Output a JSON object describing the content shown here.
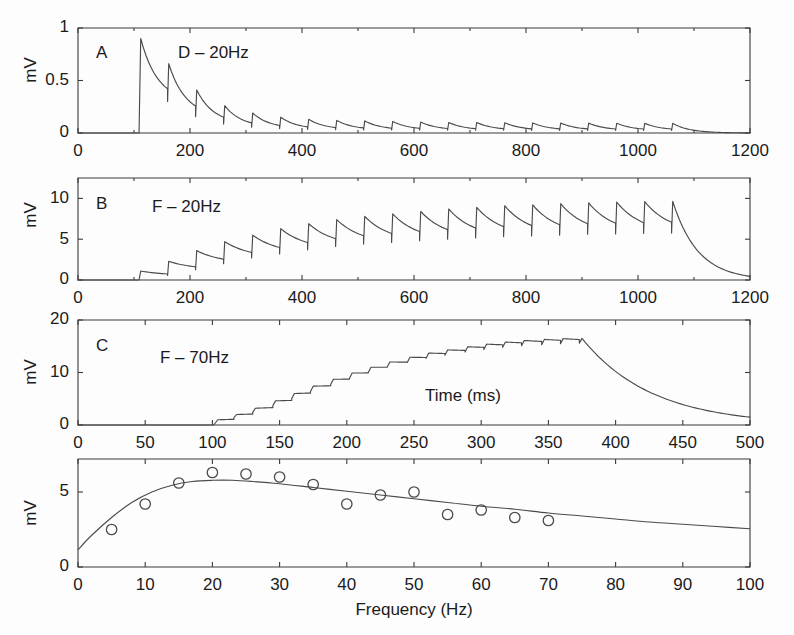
{
  "figure": {
    "background": "#fdfdfd",
    "line_color": "#4a4a4a",
    "axis_color": "#3a3a3a",
    "text_color": "#1b1b1b"
  },
  "chart_data": [
    {
      "id": "panel-a",
      "type": "line",
      "panel_letter": "A",
      "annotation": "D – 20Hz",
      "title": "",
      "xlabel": "",
      "ylabel": "mV",
      "xlim": [
        0,
        1200
      ],
      "ylim": [
        0,
        1
      ],
      "xticks": [
        0,
        200,
        400,
        600,
        800,
        1000,
        1200
      ],
      "xticklabels": [
        "0",
        "200",
        "400",
        "600",
        "800",
        "1000",
        "1200"
      ],
      "yticks": [
        0,
        0.5,
        1
      ],
      "yticklabels": [
        "0",
        "0.5",
        "1"
      ],
      "minor_xticks": [
        100,
        300,
        500,
        700,
        900,
        1100
      ],
      "grid": false,
      "legend": "none",
      "stim_onset_ms": 100,
      "stim_offset_ms": 1100,
      "stim_freq_hz": 20,
      "description": "Depressing synapse, 20 Hz train: first EPSP ~0.90 mV, strong depression to steady state ~0.09 mV",
      "peaks": [
        {
          "t": 112,
          "v": 0.9
        },
        {
          "t": 162,
          "v": 0.66
        },
        {
          "t": 212,
          "v": 0.41
        },
        {
          "t": 262,
          "v": 0.26
        },
        {
          "t": 312,
          "v": 0.19
        },
        {
          "t": 362,
          "v": 0.15
        },
        {
          "t": 412,
          "v": 0.13
        },
        {
          "t": 462,
          "v": 0.12
        },
        {
          "t": 512,
          "v": 0.115
        },
        {
          "t": 562,
          "v": 0.11
        },
        {
          "t": 612,
          "v": 0.105
        },
        {
          "t": 662,
          "v": 0.1
        },
        {
          "t": 712,
          "v": 0.1
        },
        {
          "t": 762,
          "v": 0.098
        },
        {
          "t": 812,
          "v": 0.096
        },
        {
          "t": 862,
          "v": 0.095
        },
        {
          "t": 912,
          "v": 0.094
        },
        {
          "t": 962,
          "v": 0.093
        },
        {
          "t": 1012,
          "v": 0.092
        },
        {
          "t": 1062,
          "v": 0.092
        }
      ],
      "troughs": [
        {
          "t": 160,
          "v": 0.3
        },
        {
          "t": 210,
          "v": 0.155
        },
        {
          "t": 260,
          "v": 0.085
        },
        {
          "t": 310,
          "v": 0.055
        },
        {
          "t": 360,
          "v": 0.042
        },
        {
          "t": 410,
          "v": 0.035
        },
        {
          "t": 460,
          "v": 0.032
        },
        {
          "t": 510,
          "v": 0.03
        },
        {
          "t": 560,
          "v": 0.029
        },
        {
          "t": 610,
          "v": 0.028
        },
        {
          "t": 660,
          "v": 0.027
        },
        {
          "t": 710,
          "v": 0.026
        },
        {
          "t": 760,
          "v": 0.026
        },
        {
          "t": 810,
          "v": 0.025
        },
        {
          "t": 860,
          "v": 0.025
        },
        {
          "t": 910,
          "v": 0.025
        },
        {
          "t": 960,
          "v": 0.024
        },
        {
          "t": 1010,
          "v": 0.024
        },
        {
          "t": 1060,
          "v": 0.024
        }
      ],
      "decay_tau_ms": 30
    },
    {
      "id": "panel-b",
      "type": "line",
      "panel_letter": "B",
      "annotation": "F – 20Hz",
      "title": "",
      "xlabel": "",
      "ylabel": "mV",
      "xlim": [
        0,
        1200
      ],
      "ylim": [
        0,
        12.5
      ],
      "xticks": [
        0,
        200,
        400,
        600,
        800,
        1000,
        1200
      ],
      "xticklabels": [
        "0",
        "200",
        "400",
        "600",
        "800",
        "1000",
        "1200"
      ],
      "yticks": [
        0,
        5,
        10
      ],
      "yticklabels": [
        "0",
        "5",
        "10"
      ],
      "minor_xticks": [
        100,
        300,
        500,
        700,
        900,
        1100
      ],
      "grid": false,
      "legend": "none",
      "stim_onset_ms": 100,
      "stim_offset_ms": 1060,
      "stim_freq_hz": 20,
      "description": "Facilitating synapse, 20 Hz train: growth from ~1.1 mV to plateau ~9.6 mV then slow decay",
      "peaks": [
        {
          "t": 112,
          "v": 1.1
        },
        {
          "t": 162,
          "v": 2.3
        },
        {
          "t": 212,
          "v": 3.6
        },
        {
          "t": 262,
          "v": 4.7
        },
        {
          "t": 312,
          "v": 5.5
        },
        {
          "t": 362,
          "v": 6.3
        },
        {
          "t": 412,
          "v": 6.9
        },
        {
          "t": 462,
          "v": 7.4
        },
        {
          "t": 512,
          "v": 7.8
        },
        {
          "t": 562,
          "v": 8.1
        },
        {
          "t": 612,
          "v": 8.4
        },
        {
          "t": 662,
          "v": 8.7
        },
        {
          "t": 712,
          "v": 8.9
        },
        {
          "t": 762,
          "v": 9.1
        },
        {
          "t": 812,
          "v": 9.2
        },
        {
          "t": 862,
          "v": 9.35
        },
        {
          "t": 912,
          "v": 9.45
        },
        {
          "t": 962,
          "v": 9.55
        },
        {
          "t": 1012,
          "v": 9.6
        },
        {
          "t": 1062,
          "v": 9.65
        }
      ],
      "troughs": [
        {
          "t": 160,
          "v": 0.55
        },
        {
          "t": 210,
          "v": 1.25
        },
        {
          "t": 260,
          "v": 2.0
        },
        {
          "t": 310,
          "v": 2.7
        },
        {
          "t": 360,
          "v": 3.2
        },
        {
          "t": 410,
          "v": 3.7
        },
        {
          "t": 460,
          "v": 4.1
        },
        {
          "t": 510,
          "v": 4.4
        },
        {
          "t": 560,
          "v": 4.6
        },
        {
          "t": 610,
          "v": 4.8
        },
        {
          "t": 660,
          "v": 5.0
        },
        {
          "t": 710,
          "v": 5.15
        },
        {
          "t": 760,
          "v": 5.3
        },
        {
          "t": 810,
          "v": 5.4
        },
        {
          "t": 860,
          "v": 5.5
        },
        {
          "t": 910,
          "v": 5.6
        },
        {
          "t": 960,
          "v": 5.65
        },
        {
          "t": 1010,
          "v": 5.7
        },
        {
          "t": 1060,
          "v": 5.75
        }
      ],
      "decay_tau_ms": 45
    },
    {
      "id": "panel-c",
      "type": "line",
      "panel_letter": "C",
      "annotation": "F – 70Hz",
      "title": "",
      "xlabel": "Time (ms)",
      "ylabel": "mV",
      "xlim": [
        0,
        500
      ],
      "ylim": [
        0,
        20
      ],
      "xticks": [
        0,
        50,
        100,
        150,
        200,
        250,
        300,
        350,
        400,
        450,
        500
      ],
      "xticklabels": [
        "0",
        "50",
        "100",
        "150",
        "200",
        "250",
        "300",
        "350",
        "400",
        "450",
        "500"
      ],
      "yticks": [
        0,
        10,
        20
      ],
      "yticklabels": [
        "0",
        "10",
        "20"
      ],
      "minor_xticks": [],
      "grid": false,
      "legend": "none",
      "stim_onset_ms": 100,
      "stim_offset_ms": 378,
      "stim_freq_hz": 70,
      "description": "Facilitating synapse, 70 Hz train: staircase summation to ~16.5 mV plateau, then exponential decay to ~1.6 mV at 500 ms",
      "peaks": [
        {
          "t": 104,
          "v": 1.0
        },
        {
          "t": 118,
          "v": 2.0
        },
        {
          "t": 132,
          "v": 3.2
        },
        {
          "t": 147,
          "v": 4.6
        },
        {
          "t": 161,
          "v": 6.0
        },
        {
          "t": 175,
          "v": 7.4
        },
        {
          "t": 190,
          "v": 8.7
        },
        {
          "t": 204,
          "v": 9.9
        },
        {
          "t": 218,
          "v": 11.0
        },
        {
          "t": 232,
          "v": 12.0
        },
        {
          "t": 247,
          "v": 12.9
        },
        {
          "t": 261,
          "v": 13.7
        },
        {
          "t": 275,
          "v": 14.3
        },
        {
          "t": 290,
          "v": 14.9
        },
        {
          "t": 304,
          "v": 15.4
        },
        {
          "t": 318,
          "v": 15.8
        },
        {
          "t": 332,
          "v": 16.1
        },
        {
          "t": 347,
          "v": 16.3
        },
        {
          "t": 361,
          "v": 16.45
        },
        {
          "t": 375,
          "v": 16.5
        }
      ],
      "troughs": [
        {
          "t": 116,
          "v": 1.4
        },
        {
          "t": 130,
          "v": 2.4
        },
        {
          "t": 145,
          "v": 3.7
        },
        {
          "t": 159,
          "v": 5.0
        },
        {
          "t": 173,
          "v": 6.4
        },
        {
          "t": 188,
          "v": 7.7
        },
        {
          "t": 202,
          "v": 8.9
        },
        {
          "t": 216,
          "v": 10.0
        },
        {
          "t": 230,
          "v": 11.0
        },
        {
          "t": 245,
          "v": 11.9
        },
        {
          "t": 259,
          "v": 12.7
        },
        {
          "t": 273,
          "v": 13.3
        },
        {
          "t": 288,
          "v": 13.9
        },
        {
          "t": 302,
          "v": 14.4
        },
        {
          "t": 316,
          "v": 14.8
        },
        {
          "t": 330,
          "v": 15.1
        },
        {
          "t": 345,
          "v": 15.3
        },
        {
          "t": 359,
          "v": 15.5
        },
        {
          "t": 373,
          "v": 15.6
        }
      ],
      "decay_tau_ms": 52
    },
    {
      "id": "panel-d",
      "type": "scatter",
      "panel_letter": "",
      "annotation": "",
      "title": "",
      "xlabel": "Frequency (Hz)",
      "ylabel": "mV",
      "xlim": [
        0,
        100
      ],
      "ylim": [
        0,
        7.2
      ],
      "xticks": [
        0,
        10,
        20,
        30,
        40,
        50,
        60,
        70,
        80,
        90,
        100
      ],
      "xticklabels": [
        "0",
        "10",
        "20",
        "30",
        "40",
        "50",
        "60",
        "70",
        "80",
        "90",
        "100"
      ],
      "yticks": [
        0,
        5
      ],
      "yticklabels": [
        "0",
        "5"
      ],
      "minor_xticks": [],
      "grid": false,
      "legend": "none",
      "marker": "open-circle",
      "description": "Steady-state EPSP amplitude vs stimulation frequency: open circles are data, solid line is model fit peaking near 20 Hz",
      "scatter_x": [
        5,
        10,
        15,
        20,
        25,
        30,
        35,
        40,
        45,
        50,
        55,
        60,
        65,
        70
      ],
      "scatter_y": [
        2.5,
        4.2,
        5.6,
        6.3,
        6.2,
        6.0,
        5.5,
        4.2,
        4.8,
        5.0,
        3.5,
        3.8,
        3.3,
        3.1
      ],
      "fit_x": [
        0,
        2,
        5,
        8,
        11,
        14,
        17,
        20,
        23,
        26,
        30,
        35,
        40,
        45,
        50,
        55,
        60,
        65,
        70,
        75,
        80,
        85,
        90,
        95,
        100
      ],
      "fit_y": [
        1.15,
        2.1,
        3.3,
        4.3,
        5.0,
        5.45,
        5.7,
        5.78,
        5.78,
        5.7,
        5.55,
        5.3,
        5.05,
        4.8,
        4.55,
        4.3,
        4.05,
        3.85,
        3.6,
        3.4,
        3.2,
        3.0,
        2.85,
        2.7,
        2.55
      ]
    }
  ],
  "labels": {
    "panel_a_letter": "A",
    "panel_a_cond": "D – 20Hz",
    "panel_b_letter": "B",
    "panel_b_cond": "F – 20Hz",
    "panel_c_letter": "C",
    "panel_c_cond": "F – 70Hz",
    "ylabel_a": "mV",
    "ylabel_b": "mV",
    "ylabel_c": "mV",
    "ylabel_d": "mV",
    "xlabel_c": "Time (ms)",
    "xlabel_d": "Frequency (Hz)"
  }
}
